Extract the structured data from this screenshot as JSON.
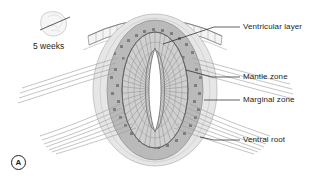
{
  "figure": {
    "panel_letter": "A",
    "stage_label": "5 weeks",
    "background_color": "#ffffff",
    "text_color": "#231f20"
  },
  "inset": {
    "name": "embryo-sketch",
    "description": "embryo with section plane line"
  },
  "labels": [
    {
      "id": "ventricular-layer",
      "text": "Ventricular layer",
      "text_x": 243,
      "text_y": 23,
      "leader_x1": 214,
      "leader_y1": 27,
      "leader_x2": 240,
      "leader_y2": 27,
      "pointer_x": 160,
      "pointer_y": 40
    },
    {
      "id": "mantle-zone",
      "text": "Mantle zone",
      "text_x": 243,
      "text_y": 73,
      "leader_x1": 214,
      "leader_y1": 77,
      "leader_x2": 240,
      "leader_y2": 77,
      "pointer_x": 186,
      "pointer_y": 70
    },
    {
      "id": "marginal-zone",
      "text": "Marginal zone",
      "text_x": 243,
      "text_y": 96,
      "leader_x1": 206,
      "leader_y1": 100,
      "leader_x2": 240,
      "leader_y2": 100,
      "pointer_x": 200,
      "pointer_y": 100
    },
    {
      "id": "ventral-root",
      "text": "Ventral root",
      "text_x": 243,
      "text_y": 136,
      "leader_x1": 214,
      "leader_y1": 140,
      "leader_x2": 240,
      "leader_y2": 140,
      "pointer_x": 200,
      "pointer_y": 140
    }
  ],
  "structures": {
    "ectoderm_arc": {
      "name": "surface-ectoderm-arc",
      "stroke": "#8c8c8c",
      "fill": "#f2f2f2"
    },
    "marginal_zone": {
      "name": "marginal-zone-region",
      "fill": "#e4e4e4",
      "stroke": "#a8a8a8"
    },
    "mantle_zone": {
      "name": "mantle-zone-region",
      "fill": "#b9b9b9",
      "stroke": "#8a8a8a",
      "cell_fill": "#7d7d7d"
    },
    "ventricular_layer": {
      "name": "ventricular-layer-region",
      "fill": "#cfcfcf",
      "stroke": "#6f6f6f"
    },
    "lumen": {
      "name": "central-canal-lumen",
      "fill": "#ffffff",
      "stroke": "#6f6f6f"
    },
    "ventral_roots": {
      "name": "ventral-root-fibers",
      "stroke": "#9a9a9a",
      "left_count": 7,
      "right_count": 7
    }
  }
}
